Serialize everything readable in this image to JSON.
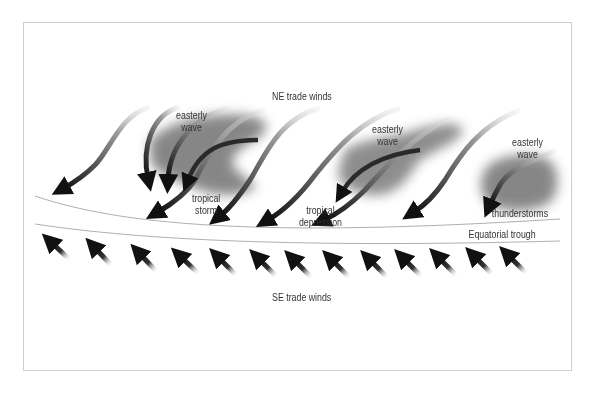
{
  "labels": {
    "ne_trade_winds": "NE trade winds",
    "se_trade_winds": "SE trade winds",
    "equatorial_trough": "Equatorial trough",
    "easterly_wave_1_line1": "easterly",
    "easterly_wave_1_line2": "wave",
    "easterly_wave_2_line1": "easterly",
    "easterly_wave_2_line2": "wave",
    "easterly_wave_3_line1": "easterly",
    "easterly_wave_3_line2": "wave",
    "tropical_storm_line1": "tropical",
    "tropical_storm_line2": "storm",
    "tropical_depression_line1": "tropical",
    "tropical_depression_line2": "depression",
    "thunderstorms": "thunderstorms"
  },
  "colors": {
    "arrow_dark": "#111111",
    "arrow_light": "#bdbdbd",
    "cloud": "#7a7a7a",
    "line": "#9a9a9a",
    "frame": "#cfcfcf",
    "text": "#333333"
  },
  "features": {
    "ne_arrow_count": 9,
    "se_arrow_count": 13,
    "cloud_systems": [
      "easterly wave / tropical storm",
      "easterly wave / tropical depression",
      "easterly wave / thunderstorms"
    ]
  }
}
